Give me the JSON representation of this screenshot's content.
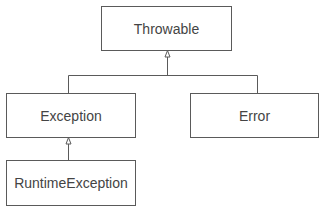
{
  "diagram": {
    "type": "class-hierarchy",
    "nodes": {
      "throwable": {
        "label": "Throwable"
      },
      "exception": {
        "label": "Exception"
      },
      "error": {
        "label": "Error"
      },
      "runtime_exception": {
        "label": "RuntimeException"
      }
    },
    "edges": [
      {
        "from": "Exception",
        "to": "Throwable",
        "kind": "inheritance"
      },
      {
        "from": "Error",
        "to": "Throwable",
        "kind": "inheritance"
      },
      {
        "from": "RuntimeException",
        "to": "Exception",
        "kind": "inheritance"
      }
    ],
    "colors": {
      "line": "#5a5a5a",
      "text": "#444444",
      "background": "#ffffff"
    }
  }
}
